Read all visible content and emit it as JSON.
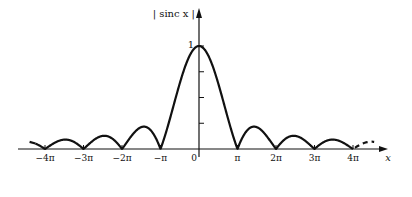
{
  "chart_data": {
    "type": "line",
    "title": "",
    "xlabel": "x",
    "ylabel": "| sinc x |",
    "function": "|sin(x)/x|",
    "xlim": [
      -4.4,
      4.6
    ],
    "xlim_units": "pi",
    "ylim": [
      0,
      1.1
    ],
    "x_ticks": [
      {
        "value": -4,
        "label": "−4π"
      },
      {
        "value": -3,
        "label": "−3π"
      },
      {
        "value": -2,
        "label": "−2π"
      },
      {
        "value": -1,
        "label": "−π"
      },
      {
        "value": 0,
        "label": "0"
      },
      {
        "value": 1,
        "label": "π"
      },
      {
        "value": 2,
        "label": "2π"
      },
      {
        "value": 3,
        "label": "3π"
      },
      {
        "value": 4,
        "label": "4π"
      }
    ],
    "y_ticks": [
      {
        "value": 0.25,
        "label": ""
      },
      {
        "value": 0.5,
        "label": ""
      },
      {
        "value": 0.75,
        "label": ""
      },
      {
        "value": 1,
        "label": "1"
      }
    ],
    "annotations": [
      "curve continues dashed beyond ±4π"
    ],
    "series": [
      {
        "name": "|sinc x|",
        "peak": {
          "x": 0,
          "y": 1
        },
        "zeros_at_pi_multiples": [
          -4,
          -3,
          -2,
          -1,
          1,
          2,
          3,
          4
        ],
        "lobe_peaks": [
          {
            "x_pi": -3.47,
            "y": 0.09
          },
          {
            "x_pi": -2.46,
            "y": 0.13
          },
          {
            "x_pi": -1.43,
            "y": 0.22
          },
          {
            "x_pi": 1.43,
            "y": 0.22
          },
          {
            "x_pi": 2.46,
            "y": 0.13
          },
          {
            "x_pi": 3.47,
            "y": 0.09
          }
        ]
      }
    ],
    "grid": false,
    "legend": "none"
  },
  "layout": {
    "origin_px": [
      199,
      149
    ],
    "px_per_pi": 38.5,
    "px_per_unit_y": 103,
    "x_axis_start_px": 18,
    "x_axis_end_px": 388,
    "y_axis_top_px": 8
  },
  "labels": {
    "ylabel": "| sinc x |",
    "xlabel": "x",
    "y_one": "1"
  },
  "colors": {
    "curve": "#111111",
    "axes": "#111111"
  }
}
